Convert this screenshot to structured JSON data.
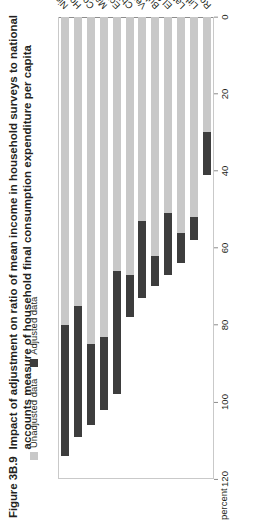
{
  "figure": {
    "number": "Figure 3B.9",
    "title": "Impact of adjustment on ratio of mean income in household surveys to national accounts measure of household final consumption expenditure per capita"
  },
  "legend": {
    "position": "top-left",
    "items": [
      {
        "label": "Unadjusted data",
        "color": "#c8c8c8"
      },
      {
        "label": "Adjusted data",
        "color": "#3d3d3d"
      }
    ]
  },
  "axis": {
    "unit_label": "percent",
    "ticks": [
      "120",
      "100",
      "80",
      "60",
      "40",
      "20",
      "0"
    ]
  },
  "chart_data": {
    "type": "bar",
    "orientation": "horizontal",
    "title": "Impact of adjustment on ratio of mean income in household surveys to national accounts measure of household final consumption expenditure per capita",
    "xlabel": "percent",
    "ylabel": "",
    "xlim": [
      0,
      120
    ],
    "reversed_x_axis": true,
    "grid": false,
    "legend": [
      "Unadjusted data",
      "Adjusted data"
    ],
    "legend_position": "top-left",
    "categories": [
      "Nicaragua",
      "Honduras",
      "Costa Rica",
      "Malaysia",
      "Ecuador",
      "Chile",
      "Venezuela",
      "Bulgaria",
      "El Salvador",
      "Latvia",
      "Lithuania",
      "Romania"
    ],
    "series": [
      {
        "name": "Unadjusted data",
        "color": "#c8c8c8",
        "values": [
          114,
          109,
          106,
          102,
          98,
          78,
          73,
          70,
          67,
          64,
          58,
          41
        ]
      },
      {
        "name": "Adjusted data",
        "color": "#3d3d3d",
        "values": [
          80,
          75,
          85,
          83,
          66,
          67,
          53,
          62,
          51,
          56,
          52,
          30
        ]
      }
    ]
  }
}
